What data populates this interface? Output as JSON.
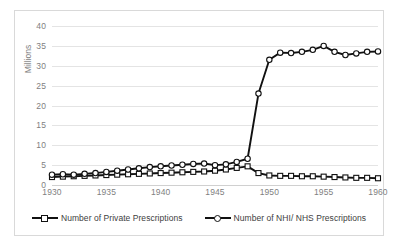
{
  "chart_data": {
    "type": "line",
    "title": "",
    "xlabel": "",
    "ylabel": "Millions",
    "xlim": [
      1930,
      1960
    ],
    "ylim": [
      0,
      40
    ],
    "ytick_step": 5,
    "yticks": [
      0,
      5,
      10,
      15,
      20,
      25,
      30,
      35,
      40
    ],
    "xticks": [
      1930,
      1935,
      1940,
      1945,
      1950,
      1955,
      1960
    ],
    "grid": true,
    "legend_position": "bottom",
    "x": [
      1930,
      1931,
      1932,
      1933,
      1934,
      1935,
      1936,
      1937,
      1938,
      1939,
      1940,
      1941,
      1942,
      1943,
      1944,
      1945,
      1946,
      1947,
      1948,
      1949,
      1950,
      1951,
      1952,
      1953,
      1954,
      1955,
      1956,
      1957,
      1958,
      1959,
      1960
    ],
    "series": [
      {
        "name": "Number of Private Prescriptions",
        "marker": "square",
        "color": "#111111",
        "values": [
          2.0,
          2.1,
          2.2,
          2.3,
          2.4,
          2.5,
          2.6,
          2.7,
          2.8,
          2.9,
          3.0,
          3.1,
          3.2,
          3.3,
          3.4,
          3.6,
          3.9,
          4.3,
          4.7,
          3.0,
          2.4,
          2.3,
          2.3,
          2.2,
          2.2,
          2.1,
          2.0,
          1.9,
          1.8,
          1.8,
          1.7
        ]
      },
      {
        "name": "Number of NHI/ NHS Prescriptions",
        "marker": "circle",
        "color": "#111111",
        "values": [
          2.6,
          2.7,
          2.6,
          2.8,
          3.0,
          3.3,
          3.6,
          3.9,
          4.2,
          4.5,
          4.7,
          4.9,
          5.1,
          5.3,
          5.4,
          5.0,
          5.2,
          5.8,
          6.6,
          23.0,
          31.5,
          33.3,
          33.2,
          33.5,
          34.0,
          35.0,
          33.5,
          32.7,
          33.1,
          33.5,
          33.6
        ]
      }
    ]
  },
  "legend": {
    "items": [
      {
        "label": "Number of Private Prescriptions",
        "marker": "square"
      },
      {
        "label": "Number of NHI/ NHS Prescriptions",
        "marker": "circle"
      }
    ]
  },
  "axis": {
    "y_title": "Millions"
  }
}
